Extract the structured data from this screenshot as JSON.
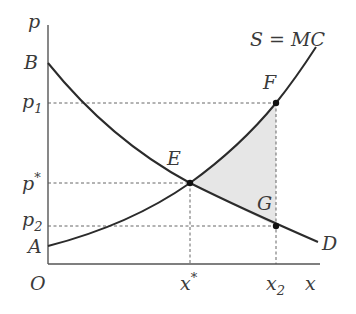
{
  "diagram": {
    "type": "supply-demand",
    "axes": {
      "y_label": "p",
      "x_label": "x",
      "origin_label": "O"
    },
    "curves": {
      "supply": {
        "label": "S = MC",
        "intercept_label": "A"
      },
      "demand": {
        "label": "D",
        "intercept_label": "B"
      }
    },
    "points": {
      "equilibrium": {
        "label": "E"
      },
      "supply_at_x2": {
        "label": "F"
      },
      "demand_at_x2": {
        "label": "G"
      }
    },
    "y_ticks": {
      "p1": "p",
      "p1_sub": "1",
      "pstar": "p",
      "pstar_sup": "*",
      "p2": "p",
      "p2_sub": "2"
    },
    "x_ticks": {
      "xstar": "x",
      "xstar_sup": "*",
      "x2": "x",
      "x2_sub": "2"
    },
    "shaded_region": "triangle EFG (deadweight loss)",
    "colors": {
      "curve": "#2b2b2b",
      "shade": "#e6e6e6",
      "text": "#3a3a3a"
    }
  }
}
